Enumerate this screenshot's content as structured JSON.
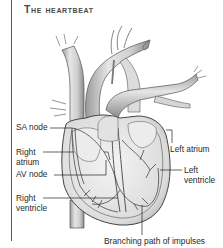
{
  "title": "The heartbeat",
  "labels": {
    "sa_node": "SA node",
    "right_atrium_1": "Right",
    "right_atrium_2": "atrium",
    "av_node": "AV node",
    "right_ventricle_1": "Right",
    "right_ventricle_2": "ventricle",
    "left_atrium": "Left atrium",
    "left_ventricle_1": "Left",
    "left_ventricle_2": "ventricle",
    "branching": "Branching path of impulses"
  },
  "colors": {
    "ink": "#2a2a2a",
    "title": "#4a4a4a",
    "shade": "#c8c8c8",
    "background": "#ffffff"
  }
}
